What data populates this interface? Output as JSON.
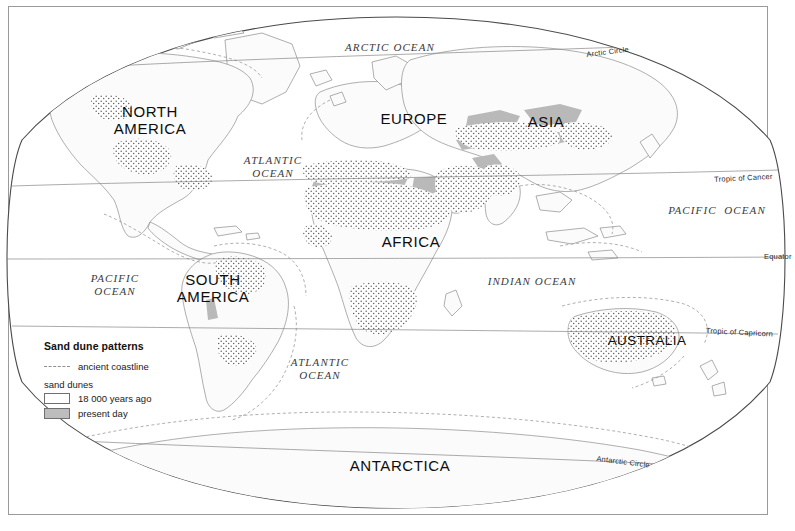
{
  "map": {
    "projection": "elliptical world projection",
    "title_in_legend": "Sand dune patterns",
    "continents": [
      {
        "key": "north-america",
        "lines": [
          "NORTH",
          "AMERICA"
        ],
        "x": 100,
        "y": 103,
        "w": 100
      },
      {
        "key": "south-america",
        "lines": [
          "SOUTH",
          "AMERICA"
        ],
        "x": 165,
        "y": 271,
        "w": 96
      },
      {
        "key": "europe",
        "lines": [
          "EUROPE"
        ],
        "x": 372,
        "y": 110,
        "w": 84
      },
      {
        "key": "asia",
        "lines": [
          "ASIA"
        ],
        "x": 515,
        "y": 113,
        "w": 62
      },
      {
        "key": "africa",
        "lines": [
          "AFRICA"
        ],
        "x": 371,
        "y": 233,
        "w": 80
      },
      {
        "key": "australia",
        "lines": [
          "AUSTRALIA"
        ],
        "x": 605,
        "y": 332,
        "w": 84
      },
      {
        "key": "antarctica",
        "lines": [
          "ANTARCTICA"
        ],
        "x": 340,
        "y": 457,
        "w": 120
      }
    ],
    "oceans": [
      {
        "key": "arctic-ocean",
        "lines": [
          "ARCTIC OCEAN"
        ],
        "x": 340,
        "y": 41,
        "w": 100
      },
      {
        "key": "atlantic-ocean-n",
        "lines": [
          "ATLANTIC",
          "OCEAN"
        ],
        "x": 228,
        "y": 154,
        "w": 90
      },
      {
        "key": "pacific-ocean-e",
        "lines": [
          "PACIFIC  OCEAN"
        ],
        "x": 662,
        "y": 204,
        "w": 110
      },
      {
        "key": "pacific-ocean-w",
        "lines": [
          "PACIFIC",
          "OCEAN"
        ],
        "x": 76,
        "y": 272,
        "w": 78
      },
      {
        "key": "indian-ocean",
        "lines": [
          "INDIAN OCEAN"
        ],
        "x": 482,
        "y": 275,
        "w": 100
      },
      {
        "key": "atlantic-ocean-s",
        "lines": [
          "ATLANTIC",
          "OCEAN"
        ],
        "x": 275,
        "y": 356,
        "w": 90
      }
    ],
    "parallels": [
      {
        "key": "arctic-circle",
        "label": "Arctic Circle",
        "x": 586,
        "y": 50,
        "rotate": -7
      },
      {
        "key": "tropic-of-cancer",
        "label": "Tropic of Cancer",
        "x": 714,
        "y": 175,
        "rotate": -3
      },
      {
        "key": "equator",
        "label": "Equator",
        "x": 764,
        "y": 252,
        "rotate": 0
      },
      {
        "key": "tropic-of-capricorn",
        "label": "Tropic of Capricorn",
        "x": 706,
        "y": 326,
        "rotate": 3
      },
      {
        "key": "antarctic-circle",
        "label": "Antarctic Circle",
        "x": 597,
        "y": 454,
        "rotate": 7
      }
    ]
  },
  "legend": {
    "title": "Sand dune patterns",
    "coastline_label": "ancient coastline",
    "dunes_heading": "sand dunes",
    "items": [
      {
        "key": "dunes-18000",
        "label": "18 000 years ago",
        "swatch": "stipple-swatch"
      },
      {
        "key": "dunes-present",
        "label": "present day",
        "swatch": "solid-gray-swatch"
      }
    ]
  },
  "colors": {
    "land_outline": "#8d8d8d",
    "ancient_coastline": "#9b9b9b",
    "dune_present": "#b9b9b9",
    "dune_ancient_stipple": "#6b6b6b",
    "graticule": "#7d7d7d",
    "frame": "#9a9a9a",
    "land_fill": "#fbfbfb",
    "text": "#121212"
  }
}
